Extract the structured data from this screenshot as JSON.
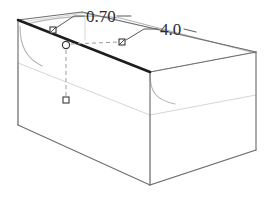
{
  "view": {
    "title": "3D fillet edge preview",
    "background_color": "#ffffff",
    "width": 267,
    "height": 207
  },
  "model": {
    "shape_name": "rectangular-box",
    "projection": "isometric",
    "edge_color_visible": "#6d6d6d",
    "edge_color_hidden": "#d2d2d2",
    "edge_color_highlight": "#1c1c1c",
    "fillet_curve_color": "#8a8a8a"
  },
  "dimensions": [
    {
      "id": "fillet-radius",
      "label": "0.70",
      "label_x": 88,
      "label_y": 20,
      "marker_x": 53,
      "marker_y": 30
    },
    {
      "id": "edge-length",
      "label": "4.0",
      "label_x": 162,
      "label_y": 35,
      "marker_x": 122,
      "marker_y": 42
    }
  ],
  "handles": {
    "origin_circle": {
      "name": "origin-control-point",
      "x": 66,
      "y": 45,
      "r": 3.6
    },
    "squares": [
      {
        "name": "radius-handle",
        "x": 53,
        "y": 30,
        "size": 6
      },
      {
        "name": "length-handle",
        "x": 122,
        "y": 42,
        "size": 6
      },
      {
        "name": "depth-handle",
        "x": 66,
        "y": 100,
        "size": 6
      }
    ],
    "dashed_color": "#9a9a9a"
  },
  "geometry": {
    "top_face": "M 18,20 L 82,12 L 256,52 L 150,72 Z",
    "front_face": "M 18,20 L 18,125 L 150,185 L 150,72 Z",
    "right_face": "M 150,72 L 256,52 L 256,150 L 150,185 Z",
    "highlight_edge": "M 18,20 L 150,72",
    "vertical_front_edge": "M 150,72 L 150,185",
    "left_vertical_edge": "M 18,20 L 18,125",
    "right_vertical_edge": "M 256,52 L 256,150",
    "bottom_front_left": "M 18,125 L 150,185",
    "bottom_front_right": "M 150,185 L 256,150"
  }
}
